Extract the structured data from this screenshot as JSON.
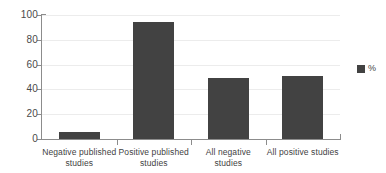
{
  "chart_data": {
    "type": "bar",
    "title": "",
    "subtitle": "",
    "xlabel": "",
    "ylabel": "",
    "categories": [
      "Negative published studies",
      "Positive published studies",
      "All negative studies",
      "All positive studies"
    ],
    "values": [
      6,
      94,
      49,
      51
    ],
    "series": [
      {
        "name": "%",
        "values": [
          6,
          94,
          49,
          51
        ],
        "color": "#424242"
      }
    ],
    "ylim": [
      0,
      100
    ],
    "y_ticks": [
      0,
      20,
      40,
      60,
      80,
      100
    ],
    "y_tick_labels": [
      "0",
      "20",
      "40",
      "60",
      "80",
      "100"
    ],
    "grid": "horizontal",
    "legend": {
      "position": "right",
      "entries": [
        {
          "label": "%",
          "color": "#424242",
          "swatch": "square-swatch"
        }
      ]
    },
    "axis_color": "#8c8c8c",
    "gridline_color": "#ececec",
    "background": "#ffffff"
  }
}
